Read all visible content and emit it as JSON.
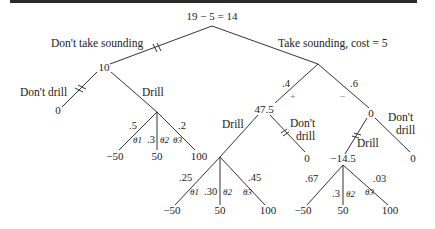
{
  "diagram": {
    "type": "decision-tree",
    "root": {
      "value": "19 − 5 = 14"
    },
    "branches": {
      "no_sounding": {
        "label": "Don't take sounding",
        "pruned": true,
        "value": "10",
        "dont_drill": {
          "label": "Don't drill",
          "pruned": true,
          "payoff": "0"
        },
        "drill": {
          "label": "Drill",
          "outcomes": [
            {
              "prob": ".5",
              "state": "θ1",
              "payoff": "−50"
            },
            {
              "prob": ".3",
              "state": "θ2",
              "payoff": "50"
            },
            {
              "prob": ".2",
              "state": "θ3",
              "payoff": "100"
            }
          ]
        }
      },
      "sounding": {
        "label": "Take sounding, cost = 5",
        "results": {
          "positive": {
            "prob": ".4",
            "sign": "+",
            "value": "47.5",
            "drill": {
              "label": "Drill",
              "outcomes": [
                {
                  "prob": ".25",
                  "state": "θ1",
                  "payoff": "−50"
                },
                {
                  "prob": ".30",
                  "state": "θ2",
                  "payoff": "50"
                },
                {
                  "prob": ".45",
                  "state": "θ3",
                  "payoff": "100"
                }
              ]
            },
            "dont_drill": {
              "label_line1": "Don't",
              "label_line2": "drill",
              "pruned": true,
              "payoff": "0"
            }
          },
          "negative": {
            "prob": ".6",
            "sign": "−",
            "value": "0",
            "drill": {
              "label": "Drill",
              "pruned": true,
              "value": "−14.5",
              "outcomes": [
                {
                  "prob": ".67",
                  "state": "θ1",
                  "payoff": "−50"
                },
                {
                  "prob": ".3",
                  "state": "θ2",
                  "payoff": "50"
                },
                {
                  "prob": ".03",
                  "state": "θ3",
                  "payoff": "100"
                }
              ]
            },
            "dont_drill": {
              "label_line1": "Don't",
              "label_line2": "drill",
              "payoff": "0"
            }
          }
        }
      }
    }
  }
}
